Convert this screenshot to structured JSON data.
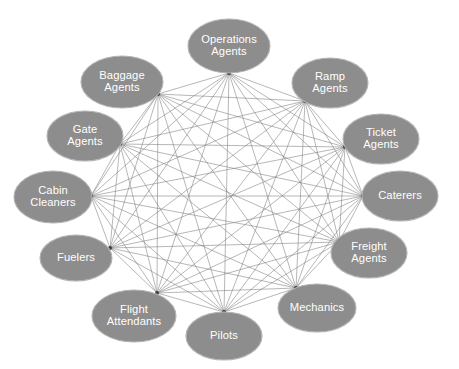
{
  "diagram": {
    "type": "network-graph",
    "topology": "complete-graph",
    "background_color": "#ffffff",
    "node_fill_color": "#8d8d8d",
    "node_stroke_color": "#b4b4b4",
    "node_text_color": "#ffffff",
    "edge_color": "#7a7a7a",
    "node_count": 12,
    "edge_count": 66,
    "layout": "circular",
    "center": {
      "x": 229,
      "y": 186
    },
    "radius_x": 152,
    "radius_y": 140,
    "node_rx": 37,
    "node_ry": 25,
    "nodes": [
      {
        "id": "operations-agents",
        "label": "Operations Agents",
        "lines": [
          "Operations",
          "Agents"
        ],
        "cx": 229,
        "cy": 46,
        "rx": 41,
        "ry": 27,
        "angle_deg": -90
      },
      {
        "id": "ramp-agents",
        "label": "Ramp Agents",
        "lines": [
          "Ramp",
          "Agents"
        ],
        "cx": 330,
        "cy": 83,
        "rx": 38,
        "ry": 25,
        "angle_deg": -60
      },
      {
        "id": "ticket-agents",
        "label": "Ticket Agents",
        "lines": [
          "Ticket",
          "Agents"
        ],
        "cx": 381,
        "cy": 139,
        "rx": 38,
        "ry": 25,
        "angle_deg": -30
      },
      {
        "id": "caterers",
        "label": "Caterers",
        "lines": [
          "Caterers"
        ],
        "cx": 400,
        "cy": 196,
        "rx": 38,
        "ry": 25,
        "angle_deg": 0
      },
      {
        "id": "freight-agents",
        "label": "Freight Agents",
        "lines": [
          "Freight",
          "Agents"
        ],
        "cx": 369,
        "cy": 253,
        "rx": 38,
        "ry": 25,
        "angle_deg": 30
      },
      {
        "id": "mechanics",
        "label": "Mechanics",
        "lines": [
          "Mechanics"
        ],
        "cx": 317,
        "cy": 308,
        "rx": 39,
        "ry": 24,
        "angle_deg": 60
      },
      {
        "id": "pilots",
        "label": "Pilots",
        "lines": [
          "Pilots"
        ],
        "cx": 224,
        "cy": 336,
        "rx": 38,
        "ry": 24,
        "angle_deg": 90
      },
      {
        "id": "flight-attendants",
        "label": "Flight Attendants",
        "lines": [
          "Flight",
          "Attendants"
        ],
        "cx": 134,
        "cy": 316,
        "rx": 42,
        "ry": 26,
        "angle_deg": 120
      },
      {
        "id": "fuelers",
        "label": "Fuelers",
        "lines": [
          "Fuelers"
        ],
        "cx": 76,
        "cy": 258,
        "rx": 36,
        "ry": 23,
        "angle_deg": 150
      },
      {
        "id": "cabin-cleaners",
        "label": "Cabin Cleaners",
        "lines": [
          "Cabin",
          "Cleaners"
        ],
        "cx": 53,
        "cy": 197,
        "rx": 39,
        "ry": 26,
        "angle_deg": 180
      },
      {
        "id": "gate-agents",
        "label": "Gate Agents",
        "lines": [
          "Gate",
          "Agents"
        ],
        "cx": 85,
        "cy": 136,
        "rx": 38,
        "ry": 25,
        "angle_deg": 210
      },
      {
        "id": "baggage-agents",
        "label": "Baggage Agents",
        "lines": [
          "Baggage",
          "Agents"
        ],
        "cx": 122,
        "cy": 82,
        "rx": 41,
        "ry": 26,
        "angle_deg": 240
      }
    ],
    "anchors": [
      {
        "id": "operations-agents",
        "x": 229,
        "y": 73
      },
      {
        "id": "ramp-agents",
        "x": 305,
        "y": 101
      },
      {
        "id": "ticket-agents",
        "x": 345,
        "y": 147
      },
      {
        "id": "caterers",
        "x": 363,
        "y": 196
      },
      {
        "id": "freight-agents",
        "x": 339,
        "y": 242
      },
      {
        "id": "mechanics",
        "x": 296,
        "y": 288
      },
      {
        "id": "pilots",
        "x": 224,
        "y": 312
      },
      {
        "id": "flight-attendants",
        "x": 157,
        "y": 293
      },
      {
        "id": "fuelers",
        "x": 110,
        "y": 248
      },
      {
        "id": "cabin-cleaners",
        "x": 91,
        "y": 196
      },
      {
        "id": "gate-agents",
        "x": 120,
        "y": 144
      },
      {
        "id": "baggage-agents",
        "x": 158,
        "y": 94
      }
    ]
  }
}
